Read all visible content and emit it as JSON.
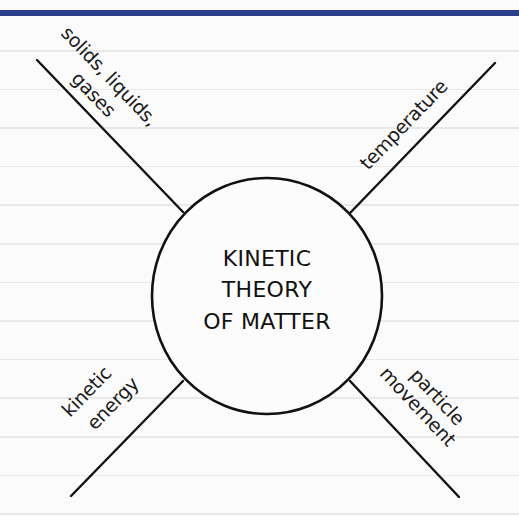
{
  "colors": {
    "header_bar": "#2a3f8a",
    "ink": "#111111",
    "paper": "#fbfbfb",
    "rule_lines": "#e9e9e9"
  },
  "diagram": {
    "type": "spider-diagram",
    "center": {
      "lines": [
        "KINETIC",
        "THEORY",
        "OF MATTER"
      ]
    },
    "branches": [
      {
        "position": "top-left",
        "lines": [
          "solids, liquids,",
          "gases"
        ]
      },
      {
        "position": "top-right",
        "lines": [
          "temperature"
        ]
      },
      {
        "position": "bottom-left",
        "lines": [
          "kinetic",
          "energy"
        ]
      },
      {
        "position": "bottom-right",
        "lines": [
          "particle",
          "movement"
        ]
      }
    ]
  }
}
